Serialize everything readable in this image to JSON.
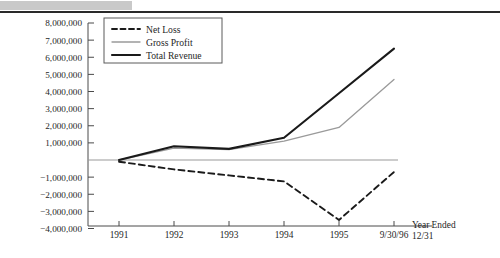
{
  "chart_data": {
    "type": "line",
    "title": "",
    "xlabel": "Year Ended 12/31",
    "ylabel": "",
    "categories": [
      "1991",
      "1992",
      "1993",
      "1994",
      "1995",
      "9/30/96"
    ],
    "ylim": [
      -4000000,
      8000000
    ],
    "ytick_labels": [
      "8,000,000",
      "7,000,000",
      "6,000,000",
      "5,000,000",
      "4,000,000",
      "3,000,000",
      "2,000,000",
      "1,000,000",
      "−1,000,000",
      "−2,000,000",
      "−3,000,000",
      "−4,000,000"
    ],
    "ytick_values": [
      8000000,
      7000000,
      6000000,
      5000000,
      4000000,
      3000000,
      2000000,
      1000000,
      -1000000,
      -2000000,
      -3000000,
      -4000000
    ],
    "grid": false,
    "legend_position": "top-left",
    "zero_line": true,
    "series": [
      {
        "name": "Net Loss",
        "style": "dashed",
        "color": "#1a1a1a",
        "values": [
          -100000,
          -550000,
          -900000,
          -1250000,
          -3500000,
          -700000
        ]
      },
      {
        "name": "Gross Profit",
        "style": "thin-solid",
        "color": "#9a9a9a",
        "values": [
          0,
          700000,
          600000,
          1100000,
          1900000,
          4700000
        ]
      },
      {
        "name": "Total Revenue",
        "style": "thick-solid",
        "color": "#1a1a1a",
        "values": [
          0,
          800000,
          650000,
          1300000,
          3900000,
          6500000
        ]
      }
    ]
  },
  "axis_caption": {
    "line1": "Year Ended",
    "line2": "12/31"
  },
  "colors": {
    "net_loss": "#1a1a1a",
    "gross_profit": "#9a9a9a",
    "total_revenue": "#1a1a1a",
    "axis": "#4a4a4a",
    "zero_line": "#9a9a9a",
    "header_block": "#c9c9c9"
  }
}
